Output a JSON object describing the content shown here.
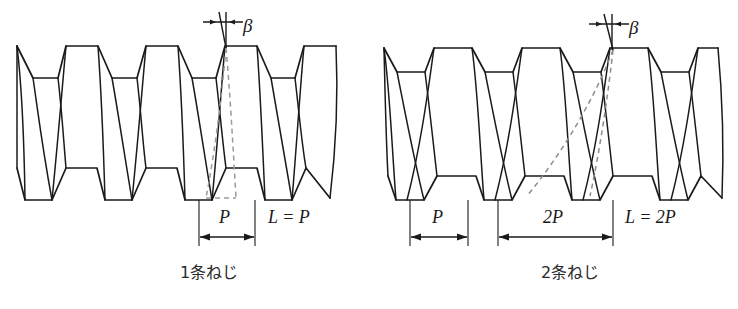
{
  "figure": {
    "background_color": "#ffffff",
    "line_color": "#1a1a1a",
    "hidden_line_color": "#9a9a9a"
  },
  "left_diagram": {
    "caption": "1条ねじ",
    "angle_label": "β",
    "pitch_label": "P",
    "lead_label": "L = P",
    "thread_starts": 1,
    "crest_count": 7,
    "lead_equals_pitch_multiple": 1
  },
  "right_diagram": {
    "caption": "2条ねじ",
    "angle_label": "β",
    "pitch_label": "P",
    "lead_span_label": "2P",
    "lead_label": "L = 2P",
    "thread_starts": 2,
    "crest_count": 7,
    "lead_equals_pitch_multiple": 2
  }
}
